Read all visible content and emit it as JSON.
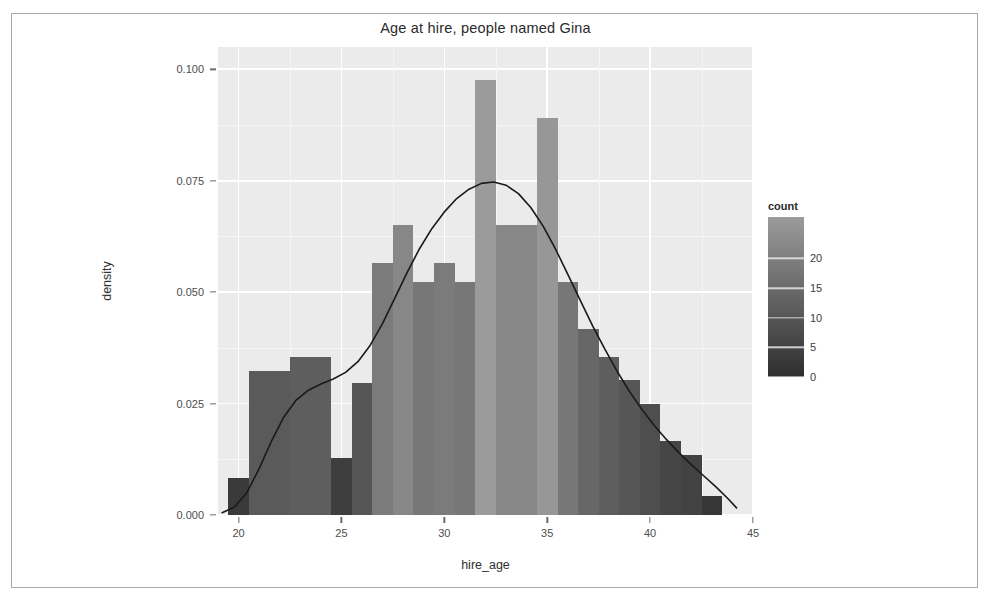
{
  "chart_data": {
    "type": "bar",
    "title": "Age at hire, people named Gina",
    "xlabel": "hire_age",
    "ylabel": "density",
    "grid": true,
    "xlim": [
      19.0,
      45.0
    ],
    "ylim": [
      0.0,
      0.105
    ],
    "xticks": [
      20,
      25,
      30,
      35,
      40,
      45
    ],
    "xtick_labels": [
      "20",
      "25",
      "30",
      "35",
      "40",
      "45"
    ],
    "yticks": [
      0.0,
      0.025,
      0.05,
      0.075,
      0.1
    ],
    "ytick_labels": [
      "0.000",
      "0.025",
      "0.050",
      "0.075",
      "0.100"
    ],
    "bin_width": 1,
    "bars": [
      {
        "x": 20,
        "density": 0.0082,
        "count": 3
      },
      {
        "x": 21,
        "density": 0.0323,
        "count": 11
      },
      {
        "x": 22,
        "density": 0.0323,
        "count": 11
      },
      {
        "x": 23,
        "density": 0.0355,
        "count": 12
      },
      {
        "x": 24,
        "density": 0.0355,
        "count": 12
      },
      {
        "x": 25,
        "density": 0.0128,
        "count": 4
      },
      {
        "x": 26,
        "density": 0.0297,
        "count": 10
      },
      {
        "x": 27,
        "density": 0.0566,
        "count": 19
      },
      {
        "x": 28,
        "density": 0.065,
        "count": 22
      },
      {
        "x": 29,
        "density": 0.0523,
        "count": 18
      },
      {
        "x": 30,
        "density": 0.0566,
        "count": 19
      },
      {
        "x": 31,
        "density": 0.0523,
        "count": 18
      },
      {
        "x": 32,
        "density": 0.0977,
        "count": 27
      },
      {
        "x": 33,
        "density": 0.065,
        "count": 22
      },
      {
        "x": 34,
        "density": 0.065,
        "count": 22
      },
      {
        "x": 35,
        "density": 0.089,
        "count": 26
      },
      {
        "x": 36,
        "density": 0.0523,
        "count": 18
      },
      {
        "x": 37,
        "density": 0.0418,
        "count": 14
      },
      {
        "x": 38,
        "density": 0.0355,
        "count": 12
      },
      {
        "x": 39,
        "density": 0.0302,
        "count": 10
      },
      {
        "x": 40,
        "density": 0.025,
        "count": 8
      },
      {
        "x": 41,
        "density": 0.0165,
        "count": 6
      },
      {
        "x": 42,
        "density": 0.0135,
        "count": 5
      },
      {
        "x": 43,
        "density": 0.0042,
        "count": 2
      }
    ],
    "density_curve": [
      {
        "x": 19.2,
        "y": 0.0005
      },
      {
        "x": 19.8,
        "y": 0.0018
      },
      {
        "x": 20.4,
        "y": 0.005
      },
      {
        "x": 21.0,
        "y": 0.0104
      },
      {
        "x": 21.6,
        "y": 0.0166
      },
      {
        "x": 22.2,
        "y": 0.022
      },
      {
        "x": 22.8,
        "y": 0.0258
      },
      {
        "x": 23.4,
        "y": 0.028
      },
      {
        "x": 24.0,
        "y": 0.0294
      },
      {
        "x": 24.6,
        "y": 0.0305
      },
      {
        "x": 25.2,
        "y": 0.032
      },
      {
        "x": 25.8,
        "y": 0.0344
      },
      {
        "x": 26.4,
        "y": 0.0381
      },
      {
        "x": 27.0,
        "y": 0.043
      },
      {
        "x": 27.6,
        "y": 0.0487
      },
      {
        "x": 28.2,
        "y": 0.0545
      },
      {
        "x": 28.8,
        "y": 0.0598
      },
      {
        "x": 29.4,
        "y": 0.0643
      },
      {
        "x": 30.0,
        "y": 0.068
      },
      {
        "x": 30.6,
        "y": 0.071
      },
      {
        "x": 31.2,
        "y": 0.0731
      },
      {
        "x": 31.8,
        "y": 0.0744
      },
      {
        "x": 32.4,
        "y": 0.0747
      },
      {
        "x": 33.0,
        "y": 0.074
      },
      {
        "x": 33.6,
        "y": 0.0721
      },
      {
        "x": 34.2,
        "y": 0.069
      },
      {
        "x": 34.8,
        "y": 0.0648
      },
      {
        "x": 35.4,
        "y": 0.0597
      },
      {
        "x": 36.0,
        "y": 0.054
      },
      {
        "x": 36.6,
        "y": 0.0482
      },
      {
        "x": 37.2,
        "y": 0.0425
      },
      {
        "x": 37.8,
        "y": 0.0372
      },
      {
        "x": 38.4,
        "y": 0.0322
      },
      {
        "x": 39.0,
        "y": 0.0277
      },
      {
        "x": 39.6,
        "y": 0.0237
      },
      {
        "x": 40.2,
        "y": 0.0201
      },
      {
        "x": 40.8,
        "y": 0.0169
      },
      {
        "x": 41.4,
        "y": 0.014
      },
      {
        "x": 42.0,
        "y": 0.0113
      },
      {
        "x": 42.6,
        "y": 0.0088
      },
      {
        "x": 43.2,
        "y": 0.0063
      },
      {
        "x": 43.8,
        "y": 0.0036
      },
      {
        "x": 44.2,
        "y": 0.0016
      }
    ],
    "legend": {
      "title": "count",
      "position": "right",
      "type": "colorbar",
      "ticks": [
        0,
        5,
        10,
        15,
        20
      ],
      "tick_labels": [
        "0",
        "5",
        "10",
        "15",
        "20"
      ],
      "range": [
        0,
        27
      ],
      "low_color": "#2e2e2e",
      "high_color": "#9b9b9b"
    },
    "colors": {
      "panel_background": "#ebebeb",
      "grid_color": "#ffffff",
      "curve_color": "#1a1a1a",
      "text_color": "#2f2f2f",
      "bar_low": "#2e2e2e",
      "bar_high": "#9b9b9b"
    }
  }
}
